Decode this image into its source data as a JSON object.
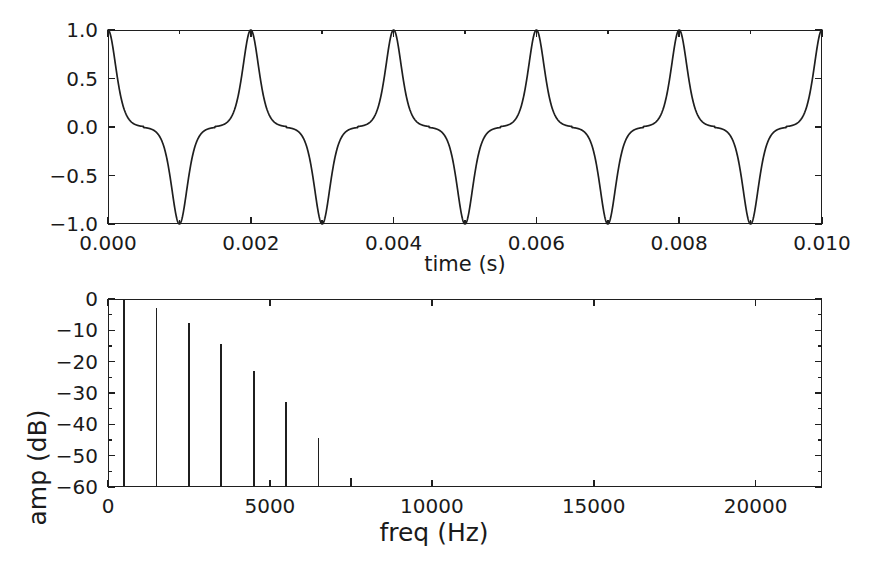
{
  "figure": {
    "background_color": "#ffffff",
    "line_color": "#1f1f1f",
    "text_color": "#1a1a1a"
  },
  "chart_data": [
    {
      "id": "waveform",
      "type": "line",
      "title": "",
      "xlabel": "time (s)",
      "ylabel": "",
      "xlim": [
        0.0,
        0.01
      ],
      "ylim": [
        -1.0,
        1.0
      ],
      "grid": false,
      "legend": false,
      "xticks": [
        0.0,
        0.002,
        0.004,
        0.006,
        0.008,
        0.01
      ],
      "xtick_labels": [
        "0.000",
        "0.002",
        "0.004",
        "0.006",
        "0.008",
        "0.010"
      ],
      "xticks_minor": [
        0.001,
        0.003,
        0.005,
        0.007,
        0.009
      ],
      "yticks": [
        -1.0,
        -0.5,
        0.0,
        0.5,
        1.0
      ],
      "ytick_labels": [
        "-1.0",
        "-0.5",
        "0.0",
        "0.5",
        "1.0"
      ],
      "description": "periodic pulse train, fundamental period 0.002 s (500 Hz), positive unit peaks at even milliseconds and negative unit peaks at odd milliseconds, flat near zero between pulses",
      "waveform_model": {
        "period_s": 0.002,
        "positive_peak_times_s": [
          0.0,
          0.002,
          0.004,
          0.006,
          0.008,
          0.01
        ],
        "negative_peak_times_s": [
          0.001,
          0.003,
          0.005,
          0.007,
          0.009
        ],
        "peak_value": 1.0,
        "trough_value": -1.0,
        "baseline_value": 0.0
      }
    },
    {
      "id": "spectrum",
      "type": "bar",
      "title": "",
      "xlabel": "freq (Hz)",
      "ylabel": "amp (dB)",
      "xlim": [
        0,
        22050
      ],
      "ylim": [
        -60,
        0
      ],
      "grid": false,
      "legend": false,
      "xticks": [
        0,
        5000,
        10000,
        15000,
        20000
      ],
      "xtick_labels": [
        "0",
        "5000",
        "10000",
        "15000",
        "20000"
      ],
      "yticks": [
        -60,
        -50,
        -40,
        -30,
        -20,
        -10,
        0
      ],
      "ytick_labels": [
        "-60",
        "-50",
        "-40",
        "-30",
        "-20",
        "-10",
        "0"
      ],
      "yticks_minor": [
        -55,
        -45,
        -35,
        -25,
        -15,
        -5
      ],
      "categories": [
        500,
        1500,
        2500,
        3500,
        4500,
        5500,
        6500,
        7500
      ],
      "values": [
        0.0,
        -3.0,
        -7.5,
        -14.5,
        -23.0,
        -33.0,
        -44.5,
        -57.0
      ],
      "series": [
        {
          "name": "harmonic amplitude",
          "points": [
            {
              "freq": 500,
              "amp_db": 0.0
            },
            {
              "freq": 1500,
              "amp_db": -3.0
            },
            {
              "freq": 2500,
              "amp_db": -7.5
            },
            {
              "freq": 3500,
              "amp_db": -14.5
            },
            {
              "freq": 4500,
              "amp_db": -23.0
            },
            {
              "freq": 5500,
              "amp_db": -33.0
            },
            {
              "freq": 6500,
              "amp_db": -44.5
            },
            {
              "freq": 7500,
              "amp_db": -57.0
            }
          ]
        }
      ],
      "description": "line spectrum of the pulse train showing odd-multiple harmonics of 500 Hz decaying from 0 dB to the -60 dB floor by 7500 Hz"
    }
  ]
}
